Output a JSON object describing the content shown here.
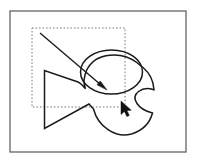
{
  "canvas": {
    "width": 197,
    "height": 163,
    "background_color": "#ffffff"
  },
  "frame": {
    "name": "artboard-frame",
    "x": 10,
    "y": 11,
    "width": 176,
    "height": 141,
    "stroke_color": "#585858",
    "stroke_width": 1.2,
    "fill": "none"
  },
  "selection_marquee": {
    "name": "selection-marquee",
    "x": 32,
    "y": 28,
    "width": 93,
    "height": 79,
    "stroke_color": "#7a7a7a",
    "stroke_width": 1,
    "dash": "1.6 1.9",
    "fill": "none"
  },
  "shapes": [
    {
      "name": "fish-body-outline",
      "type": "path",
      "stroke_color": "#1a1a1a",
      "stroke_width": 1.5,
      "fill": "none",
      "d": "M 44.5 70.5 L 44.5 128.5 L 89.0 104.0 L 93.5 109.0 C 98.0 127.0 116.0 138.5 131.5 134.0 C 142.5 130.5 150.0 122.5 152.5 113.0 L 151.0 112.5 C 145.5 111.0 140.0 108.0 137.0 103.5 C 134.0 99.0 134.5 94.5 138.5 91.5 C 142.5 88.5 148.5 88.0 153.0 89.5 L 154.0 89.8 C 153.5 81.0 149.5 73.0 143.0 67.5 L 141.0 66.0 L 137.5 63.0 C 131.0 58.0 122.5 55.0 114.0 55.0 C 103.0 55.0 93.5 59.5 88.5 67.0 L 86.5 70.5 L 85.0 75.0 L 84.0 80.0 L 84.3 84.5 L 85.5 88.8 L 83.0 86.0 L 80.5 83.5 L 78.0 82.0 Z"
    },
    {
      "name": "head-ellipse",
      "type": "ellipse",
      "cx": 111.5,
      "cy": 72.0,
      "rx": 31.0,
      "ry": 22.0,
      "stroke_color": "#1a1a1a",
      "stroke_width": 1.5,
      "fill": "none"
    }
  ],
  "direction_arrow": {
    "name": "direction-arrow",
    "x1": 40,
    "y1": 33,
    "x2": 107,
    "y2": 90,
    "stroke_color": "#1a1a1a",
    "stroke_width": 1.4,
    "head_length": 11,
    "head_width": 5
  },
  "cursor": {
    "name": "mouse-pointer",
    "tip_x": 121,
    "tip_y": 101,
    "fill_color": "#111111",
    "outline_color": "#ffffff"
  }
}
